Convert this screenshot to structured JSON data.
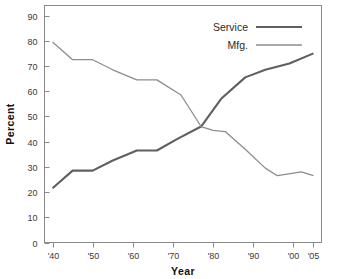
{
  "chart_data": {
    "type": "line",
    "title": "",
    "xlabel": "Year",
    "ylabel": "Percent",
    "xlim": [
      1938,
      2007
    ],
    "ylim": [
      0,
      94
    ],
    "yticks": [
      0,
      10,
      20,
      30,
      40,
      50,
      60,
      70,
      80,
      90
    ],
    "ytick_labels": [
      "0",
      "10",
      "20",
      "30",
      "40",
      "50",
      "60",
      "70",
      "80",
      "90"
    ],
    "xticks": [
      1940,
      1950,
      1960,
      1970,
      1980,
      1990,
      2000,
      2005
    ],
    "xtick_labels": [
      "'40",
      "'50",
      "'60",
      "'70",
      "'80",
      "'90",
      "'00",
      "'05"
    ],
    "grid": false,
    "legend_position": "top-right",
    "series": [
      {
        "name": "Service",
        "color": "#5f5f5f",
        "width": 2.1,
        "x": [
          1940,
          1945,
          1950,
          1955,
          1961,
          1966,
          1971,
          1977,
          1982,
          1988,
          1993,
          1999,
          2005
        ],
        "values": [
          21.5,
          28.5,
          28.5,
          32.5,
          36.5,
          36.5,
          41.0,
          46.0,
          57.0,
          65.5,
          68.5,
          71.0,
          75.0
        ]
      },
      {
        "name": "Mfg.",
        "color": "#8d8d8d",
        "width": 1.3,
        "x": [
          1940,
          1945,
          1950,
          1955,
          1961,
          1966,
          1972,
          1977,
          1980,
          1983,
          1988,
          1993,
          1996,
          2002,
          2005
        ],
        "values": [
          79.5,
          72.5,
          72.5,
          68.5,
          64.5,
          64.5,
          58.5,
          46.0,
          44.5,
          44.0,
          37.0,
          29.5,
          26.5,
          28.0,
          26.5
        ]
      }
    ],
    "legend": [
      {
        "label": "Service",
        "color": "#5f5f5f",
        "width": 2.1
      },
      {
        "label": "Mfg.",
        "color": "#8d8d8d",
        "width": 1.3
      }
    ],
    "annotations": []
  }
}
